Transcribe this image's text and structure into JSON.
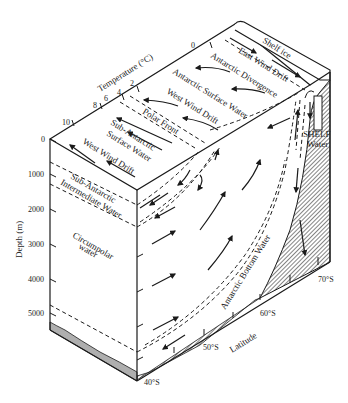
{
  "diagram": {
    "type": "block-diagram",
    "colors": {
      "ink": "#1a1a1a",
      "background": "#ffffff",
      "hatch": "#555555"
    },
    "surface_labels": {
      "shelf_ice": "Shelf ice",
      "east_wind_drift": "East Wind Drift",
      "antarctic_divergence": "Antarctic Divergence",
      "antarctic_surface_water": "Antarctic Surface Water",
      "west_wind_drift_1": "West Wind Drift",
      "polar_front": "Polar Front",
      "sub_antarctic_surface_water_1": "Sub-Antarctic",
      "sub_antarctic_surface_water_2": "Surface Water",
      "west_wind_drift_2": "West Wind Drift"
    },
    "section_labels": {
      "shelf_water_1": "SHELF",
      "shelf_water_2": "Water",
      "sub_antarctic_intermediate_1": "Sub-Antarctic",
      "sub_antarctic_intermediate_2": "Intermediate Water",
      "circumpolar_1": "Circumpolar",
      "circumpolar_2": "water",
      "antarctic_bottom_water": "Antarctic Bottom Water"
    },
    "temperature_axis": {
      "title": "Temperature (°C)",
      "ticks": [
        "10",
        "8",
        "6",
        "4",
        "2",
        "0"
      ]
    },
    "depth_axis": {
      "title": "Depth (m)",
      "ticks": [
        "0",
        "1000",
        "2000",
        "3000",
        "4000",
        "5000"
      ]
    },
    "latitude_axis": {
      "title": "Latitude",
      "ticks": [
        "40°S",
        "50°S",
        "60°S",
        "70°S"
      ]
    }
  }
}
